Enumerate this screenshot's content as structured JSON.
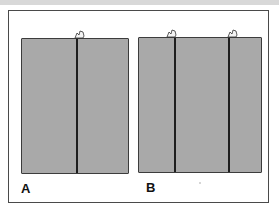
{
  "figure": {
    "background_color": "#ffffff",
    "frame_color": "#4a4a4a",
    "panel_fill_color": "#a9a9a9",
    "divider_color": "#1e1e1e",
    "panels": [
      {
        "label": "A",
        "divider_count": 1,
        "pointer_icon": "hand-pointer-icon"
      },
      {
        "label": "B",
        "divider_count": 2,
        "pointer_icon": "hand-pointer-icon"
      }
    ]
  }
}
